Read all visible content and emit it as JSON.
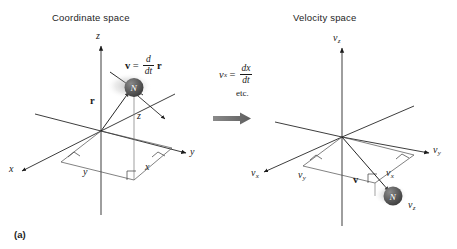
{
  "figure": {
    "label": "(a)",
    "background_color": "#ffffff",
    "ink_color": "#1a1a1a",
    "arrow_color": "#6e6e6e",
    "particle_color": "#5a5a5a"
  },
  "panels": {
    "coordinate": {
      "title": "Coordinate space",
      "axes": [
        {
          "name": "x-axis",
          "label": "x"
        },
        {
          "name": "y-axis",
          "label": "y"
        },
        {
          "name": "z-axis",
          "label": "z"
        }
      ],
      "projection_labels": [
        {
          "name": "projection-x",
          "label": "x"
        },
        {
          "name": "projection-y",
          "label": "y"
        },
        {
          "name": "projection-z",
          "label": "z"
        }
      ],
      "vectors": [
        {
          "name": "position-vector",
          "label": "r"
        },
        {
          "name": "velocity-vector",
          "label": "v"
        }
      ],
      "equation": {
        "lhs": "v",
        "equals": "=",
        "numerator": "d",
        "denominator": "dt",
        "rhs": "r"
      },
      "particle": {
        "label": "N"
      }
    },
    "velocity": {
      "title": "Velocity space",
      "axes": [
        {
          "name": "vx-axis",
          "label": "v",
          "sub": "x"
        },
        {
          "name": "vy-axis",
          "label": "v",
          "sub": "y"
        },
        {
          "name": "vz-axis",
          "label": "v",
          "sub": "z"
        }
      ],
      "projection_labels": [
        {
          "name": "projection-vx",
          "label": "v",
          "sub": "x"
        },
        {
          "name": "projection-vy",
          "label": "v",
          "sub": "y"
        },
        {
          "name": "projection-vz",
          "label": "v",
          "sub": "z"
        }
      ],
      "vectors": [
        {
          "name": "velocity-vector",
          "label": "v"
        }
      ],
      "particle": {
        "label": "N"
      }
    }
  },
  "transform": {
    "equation": {
      "lhs": "v",
      "lhs_sub": "x",
      "equals": "=",
      "numerator": "dx",
      "denominator": "dt"
    },
    "note": "etc.",
    "arrow_name": "transform-arrow"
  }
}
